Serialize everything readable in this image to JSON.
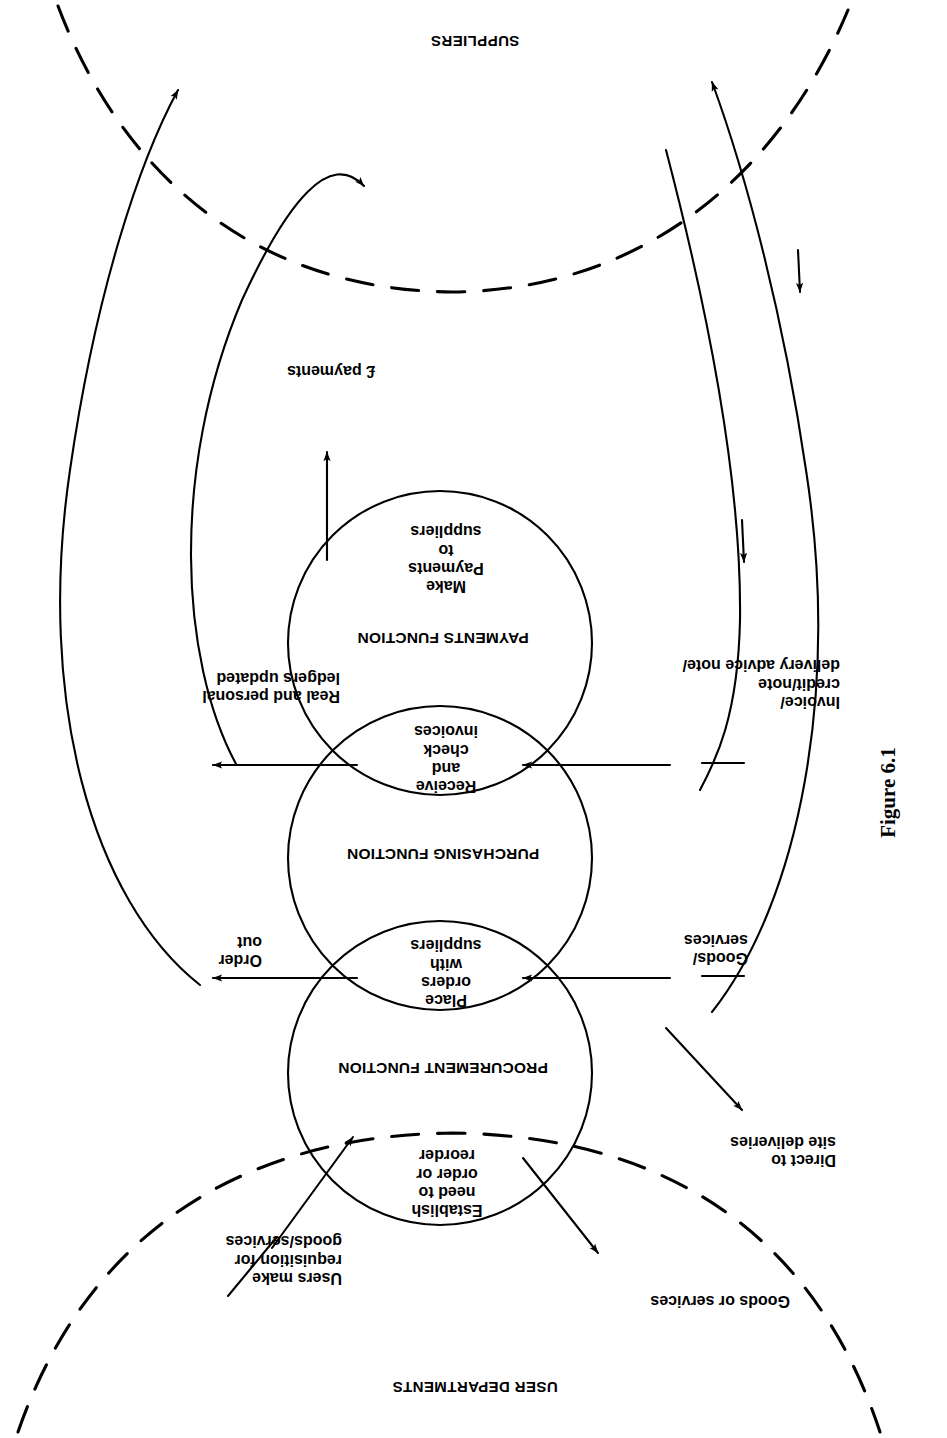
{
  "figure": {
    "caption": "Figure 6.1",
    "orientation_note": "page-rotated-180"
  },
  "boundaries": [
    {
      "id": "suppliers",
      "label": "SUPPLIERS"
    },
    {
      "id": "user-departments",
      "label": "USER DEPARTMENTS"
    }
  ],
  "functions": [
    {
      "id": "payments",
      "label": "PAYMENTS FUNCTION"
    },
    {
      "id": "purchasing",
      "label": "PURCHASING FUNCTION"
    },
    {
      "id": "procurement",
      "label": "PROCUREMENT FUNCTION"
    }
  ],
  "processes": [
    {
      "id": "make-payments",
      "label": "Make\nPayments\nto\nsuppliers"
    },
    {
      "id": "receive-check",
      "label": "Receive\nand\ncheck\ninvoices"
    },
    {
      "id": "place-orders",
      "label": "Place\norders\nwith\nsuppliers"
    },
    {
      "id": "establish-need",
      "label": "Establish\nneed to\norder or\nreorder"
    }
  ],
  "flows": [
    {
      "id": "payments-out",
      "label": "£ payments"
    },
    {
      "id": "ledgers-updated",
      "label": "Real and personal\nledgers updated"
    },
    {
      "id": "order-out",
      "label": "Order\nout"
    },
    {
      "id": "invoice-in",
      "label": "Invoice/\ncredit/note\ndelivery advice note/"
    },
    {
      "id": "goods-services-in",
      "label": "Goods/\nservices"
    },
    {
      "id": "direct-site",
      "label": "Direct to\nsite deliveries"
    },
    {
      "id": "users-requisition",
      "label": "Users make\nrequisition for\ngoods/services"
    },
    {
      "id": "goods-or-services",
      "label": "Goods or services"
    }
  ],
  "style": {
    "stroke": "#000000",
    "background": "#ffffff",
    "line_width": 2
  }
}
